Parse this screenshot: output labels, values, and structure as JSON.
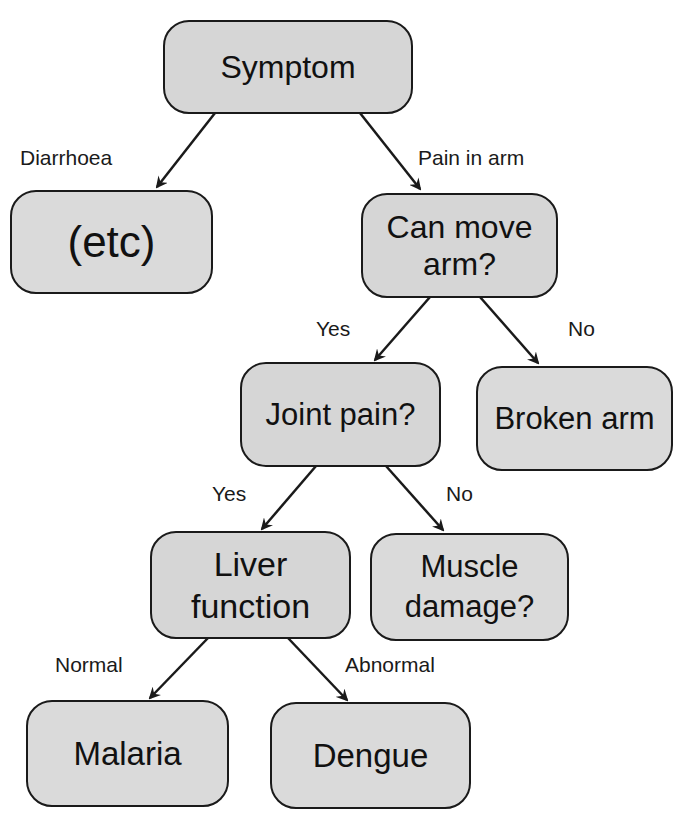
{
  "diagram": {
    "type": "decision-tree",
    "nodes": {
      "symptom": "Symptom",
      "etc": "(etc)",
      "can_move_arm_1": "Can move",
      "can_move_arm_2": "arm?",
      "joint_pain": "Joint pain?",
      "broken_arm": "Broken arm",
      "liver_1": "Liver",
      "liver_2": "function",
      "muscle_1": "Muscle",
      "muscle_2": "damage?",
      "malaria": "Malaria",
      "dengue": "Dengue"
    },
    "edges": {
      "diarrhoea": "Diarrhoea",
      "pain_in_arm": "Pain in arm",
      "move_yes": "Yes",
      "move_no": "No",
      "joint_yes": "Yes",
      "joint_no": "No",
      "liver_normal": "Normal",
      "liver_abnormal": "Abnormal"
    },
    "colors": {
      "node_fill": "#d6d6d6",
      "stroke": "#1a1a1a",
      "background": "#ffffff"
    }
  }
}
